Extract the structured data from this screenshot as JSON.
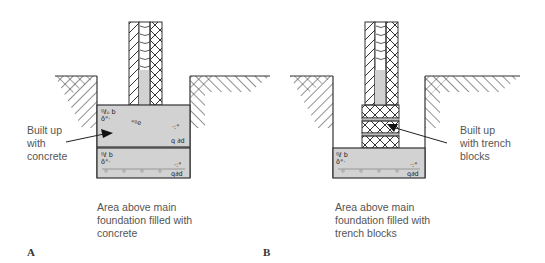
{
  "figure": {
    "panels": [
      {
        "id": "A",
        "letter": "A",
        "callout": "Built up\nwith\nconcrete",
        "caption": "Area above main\nfoundation filled with\nconcrete"
      },
      {
        "id": "B",
        "letter": "B",
        "callout": "Built up\nwith trench\nblocks",
        "caption": "Area above main\nfoundation filled with\ntrench blocks"
      }
    ],
    "colors": {
      "concrete_fill": "#d2d2d2",
      "line": "#333333",
      "text": "#555555"
    }
  }
}
